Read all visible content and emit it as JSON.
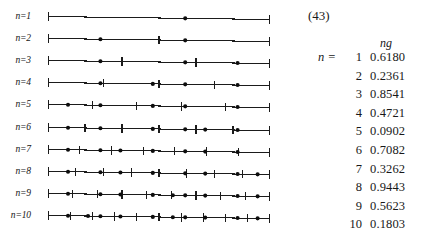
{
  "figure": {
    "equation_number": "(43)",
    "line_count": 10,
    "axis": {
      "x_start": 0,
      "x_end": 1,
      "end_caps": "vertical-ticks",
      "slope_px": -3
    },
    "rows": [
      {
        "label": "n=1",
        "n": 1,
        "ticks": [],
        "points": [
          0.618
        ]
      },
      {
        "label": "n=2",
        "n": 2,
        "ticks": [
          0.5
        ],
        "points": [
          0.2361,
          0.618
        ]
      },
      {
        "label": "n=3",
        "n": 3,
        "ticks": [
          0.3333,
          0.6667
        ],
        "points": [
          0.2361,
          0.618,
          0.8541
        ]
      },
      {
        "label": "n=4",
        "n": 4,
        "ticks": [
          0.25,
          0.5,
          0.75
        ],
        "points": [
          0.2361,
          0.4721,
          0.618,
          0.8541
        ]
      },
      {
        "label": "n=5",
        "n": 5,
        "ticks": [
          0.2,
          0.4,
          0.6,
          0.8
        ],
        "points": [
          0.0902,
          0.2361,
          0.4721,
          0.618,
          0.8541
        ]
      },
      {
        "label": "n=6",
        "n": 6,
        "ticks": [
          0.1667,
          0.3333,
          0.5,
          0.6667,
          0.8333
        ],
        "points": [
          0.0902,
          0.2361,
          0.4721,
          0.618,
          0.7082,
          0.8541
        ]
      },
      {
        "label": "n=7",
        "n": 7,
        "ticks": [
          0.1429,
          0.2857,
          0.4286,
          0.5714,
          0.7143,
          0.8571
        ],
        "points": [
          0.0902,
          0.2361,
          0.3262,
          0.4721,
          0.618,
          0.7082,
          0.8541
        ]
      },
      {
        "label": "n=8",
        "n": 8,
        "ticks": [
          0.125,
          0.25,
          0.375,
          0.5,
          0.625,
          0.75,
          0.875
        ],
        "points": [
          0.0902,
          0.2361,
          0.3262,
          0.4721,
          0.618,
          0.7082,
          0.8541,
          0.9443
        ]
      },
      {
        "label": "n=9",
        "n": 9,
        "ticks": [
          0.1111,
          0.2222,
          0.3333,
          0.4444,
          0.5556,
          0.6667,
          0.7778,
          0.8889
        ],
        "points": [
          0.0902,
          0.2361,
          0.3262,
          0.4721,
          0.5623,
          0.618,
          0.7082,
          0.8541,
          0.9443
        ]
      },
      {
        "label": "n=10",
        "n": 10,
        "ticks": [
          0.1,
          0.2,
          0.3,
          0.4,
          0.5,
          0.6,
          0.7,
          0.8,
          0.9
        ],
        "points": [
          0.0902,
          0.1803,
          0.2361,
          0.3262,
          0.4721,
          0.5623,
          0.618,
          0.7082,
          0.8541,
          0.9443
        ]
      }
    ]
  },
  "table": {
    "n_equals_label": "n  =",
    "header_value": "ng",
    "rows": [
      {
        "n": "1",
        "value": "0.6180"
      },
      {
        "n": "2",
        "value": "0.2361"
      },
      {
        "n": "3",
        "value": "0.8541"
      },
      {
        "n": "4",
        "value": "0.4721"
      },
      {
        "n": "5",
        "value": "0.0902"
      },
      {
        "n": "6",
        "value": "0.7082"
      },
      {
        "n": "7",
        "value": "0.3262"
      },
      {
        "n": "8",
        "value": "0.9443"
      },
      {
        "n": "9",
        "value": "0.5623"
      },
      {
        "n": "10",
        "value": "0.1803"
      }
    ]
  },
  "chart_data": {
    "type": "scatter",
    "title": "",
    "xlabel": "",
    "ylabel": "",
    "xlim": [
      0,
      1
    ],
    "grid": false,
    "legend": "none",
    "series": [
      {
        "name": "n=1",
        "ticks": [],
        "points": [
          0.618
        ]
      },
      {
        "name": "n=2",
        "ticks": [
          0.5
        ],
        "points": [
          0.2361,
          0.618
        ]
      },
      {
        "name": "n=3",
        "ticks": [
          0.3333,
          0.6667
        ],
        "points": [
          0.2361,
          0.618,
          0.8541
        ]
      },
      {
        "name": "n=4",
        "ticks": [
          0.25,
          0.5,
          0.75
        ],
        "points": [
          0.2361,
          0.4721,
          0.618,
          0.8541
        ]
      },
      {
        "name": "n=5",
        "ticks": [
          0.2,
          0.4,
          0.6,
          0.8
        ],
        "points": [
          0.0902,
          0.2361,
          0.4721,
          0.618,
          0.8541
        ]
      },
      {
        "name": "n=6",
        "ticks": [
          0.1667,
          0.3333,
          0.5,
          0.6667,
          0.8333
        ],
        "points": [
          0.0902,
          0.2361,
          0.4721,
          0.618,
          0.7082,
          0.8541
        ]
      },
      {
        "name": "n=7",
        "ticks": [
          0.1429,
          0.2857,
          0.4286,
          0.5714,
          0.7143,
          0.8571
        ],
        "points": [
          0.0902,
          0.2361,
          0.3262,
          0.4721,
          0.618,
          0.7082,
          0.8541
        ]
      },
      {
        "name": "n=8",
        "ticks": [
          0.125,
          0.25,
          0.375,
          0.5,
          0.625,
          0.75,
          0.875
        ],
        "points": [
          0.0902,
          0.2361,
          0.3262,
          0.4721,
          0.618,
          0.7082,
          0.8541,
          0.9443
        ]
      },
      {
        "name": "n=9",
        "ticks": [
          0.1111,
          0.2222,
          0.3333,
          0.4444,
          0.5556,
          0.6667,
          0.7778,
          0.8889
        ],
        "points": [
          0.0902,
          0.2361,
          0.3262,
          0.4721,
          0.5623,
          0.618,
          0.7082,
          0.8541,
          0.9443
        ]
      },
      {
        "name": "n=10",
        "ticks": [
          0.1,
          0.2,
          0.3,
          0.4,
          0.5,
          0.6,
          0.7,
          0.8,
          0.9
        ],
        "points": [
          0.0902,
          0.1803,
          0.2361,
          0.3262,
          0.4721,
          0.5623,
          0.618,
          0.7082,
          0.8541,
          0.9443
        ]
      }
    ],
    "table": {
      "columns": [
        "n",
        "ng"
      ],
      "rows": [
        [
          "1",
          0.618
        ],
        [
          "2",
          0.2361
        ],
        [
          "3",
          0.8541
        ],
        [
          "4",
          0.4721
        ],
        [
          "5",
          0.0902
        ],
        [
          "6",
          0.7082
        ],
        [
          "7",
          0.3262
        ],
        [
          "8",
          0.9443
        ],
        [
          "9",
          0.5623
        ],
        [
          "10",
          0.1803
        ]
      ]
    }
  }
}
